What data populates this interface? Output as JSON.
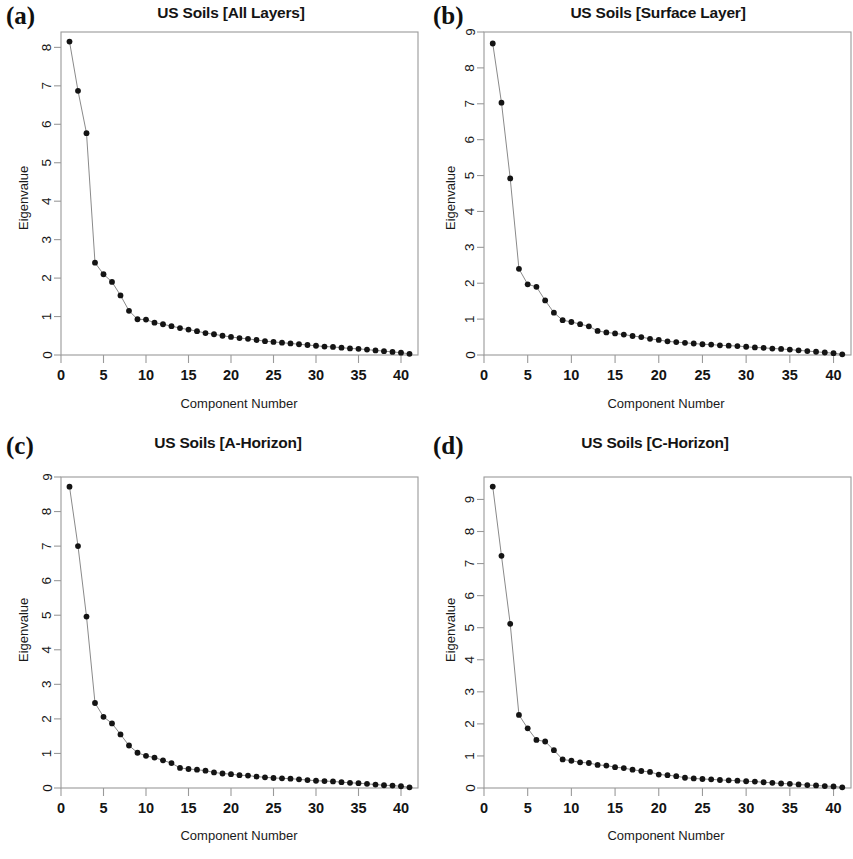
{
  "figure": {
    "background": "#ffffff",
    "point_color": "#141414",
    "line_color": "#8a8a8a",
    "axis_color": "#9a9a9a",
    "text_color": "#141414"
  },
  "panels": [
    {
      "letter": "(a)",
      "title": "US Soils [All Layers]",
      "ylabel": "Eigenvalue",
      "xlabel": "Component Number"
    },
    {
      "letter": "(b)",
      "title": "US Soils [Surface Layer]",
      "ylabel": "Eigenvalue",
      "xlabel": "Component Number"
    },
    {
      "letter": "(c)",
      "title": "US Soils [A-Horizon]",
      "ylabel": "Eigenvalue",
      "xlabel": "Component Number"
    },
    {
      "letter": "(d)",
      "title": "US Soils [C-Horizon]",
      "ylabel": "Eigenvalue",
      "xlabel": "Component Number"
    }
  ],
  "chart_data": [
    {
      "type": "line",
      "panel": "(a)",
      "title": "US Soils [All Layers]",
      "xlabel": "Component Number",
      "ylabel": "Eigenvalue",
      "xlim": [
        0,
        42
      ],
      "ylim": [
        0,
        8.4
      ],
      "xticks": [
        0,
        5,
        10,
        15,
        20,
        25,
        30,
        35,
        40
      ],
      "yticks": [
        0,
        1,
        2,
        3,
        4,
        5,
        6,
        7,
        8
      ],
      "grid": false,
      "legend": null,
      "markers": "filled-circle",
      "x": [
        1,
        2,
        3,
        4,
        5,
        6,
        7,
        8,
        9,
        10,
        11,
        12,
        13,
        14,
        15,
        16,
        17,
        18,
        19,
        20,
        21,
        22,
        23,
        24,
        25,
        26,
        27,
        28,
        29,
        30,
        31,
        32,
        33,
        34,
        35,
        36,
        37,
        38,
        39,
        40,
        41
      ],
      "values": [
        8.15,
        6.87,
        5.77,
        2.4,
        2.1,
        1.9,
        1.55,
        1.15,
        0.93,
        0.92,
        0.84,
        0.8,
        0.75,
        0.7,
        0.66,
        0.62,
        0.57,
        0.54,
        0.5,
        0.47,
        0.44,
        0.42,
        0.39,
        0.36,
        0.34,
        0.32,
        0.3,
        0.28,
        0.26,
        0.24,
        0.22,
        0.21,
        0.19,
        0.17,
        0.16,
        0.14,
        0.12,
        0.1,
        0.08,
        0.06,
        0.03
      ]
    },
    {
      "type": "line",
      "panel": "(b)",
      "title": "US Soils [Surface Layer]",
      "xlabel": "Component Number",
      "ylabel": "Eigenvalue",
      "xlim": [
        0,
        42
      ],
      "ylim": [
        0,
        9.0
      ],
      "xticks": [
        0,
        5,
        10,
        15,
        20,
        25,
        30,
        35,
        40
      ],
      "yticks": [
        0,
        1,
        2,
        3,
        4,
        5,
        6,
        7,
        8,
        9
      ],
      "grid": false,
      "legend": null,
      "markers": "filled-circle",
      "x": [
        1,
        2,
        3,
        4,
        5,
        6,
        7,
        8,
        9,
        10,
        11,
        12,
        13,
        14,
        15,
        16,
        17,
        18,
        19,
        20,
        21,
        22,
        23,
        24,
        25,
        26,
        27,
        28,
        29,
        30,
        31,
        32,
        33,
        34,
        35,
        36,
        37,
        38,
        39,
        40,
        41
      ],
      "values": [
        8.68,
        7.03,
        4.92,
        2.4,
        1.97,
        1.9,
        1.52,
        1.18,
        0.97,
        0.92,
        0.86,
        0.8,
        0.67,
        0.63,
        0.6,
        0.57,
        0.53,
        0.5,
        0.45,
        0.42,
        0.38,
        0.36,
        0.34,
        0.32,
        0.3,
        0.29,
        0.27,
        0.26,
        0.25,
        0.23,
        0.21,
        0.2,
        0.18,
        0.17,
        0.15,
        0.13,
        0.11,
        0.09,
        0.07,
        0.05,
        0.02
      ]
    },
    {
      "type": "line",
      "panel": "(c)",
      "title": "US Soils [A-Horizon]",
      "xlabel": "Component Number",
      "ylabel": "Eigenvalue",
      "xlim": [
        0,
        42
      ],
      "ylim": [
        0,
        9.0
      ],
      "xticks": [
        0,
        5,
        10,
        15,
        20,
        25,
        30,
        35,
        40
      ],
      "yticks": [
        0,
        1,
        2,
        3,
        4,
        5,
        6,
        7,
        8,
        9
      ],
      "grid": false,
      "legend": null,
      "markers": "filled-circle",
      "x": [
        1,
        2,
        3,
        4,
        5,
        6,
        7,
        8,
        9,
        10,
        11,
        12,
        13,
        14,
        15,
        16,
        17,
        18,
        19,
        20,
        21,
        22,
        23,
        24,
        25,
        26,
        27,
        28,
        29,
        30,
        31,
        32,
        33,
        34,
        35,
        36,
        37,
        38,
        39,
        40,
        41
      ],
      "values": [
        8.72,
        7.0,
        4.96,
        2.46,
        2.06,
        1.87,
        1.55,
        1.23,
        1.02,
        0.93,
        0.88,
        0.8,
        0.72,
        0.58,
        0.55,
        0.53,
        0.5,
        0.45,
        0.42,
        0.4,
        0.37,
        0.36,
        0.33,
        0.31,
        0.29,
        0.28,
        0.27,
        0.25,
        0.23,
        0.21,
        0.2,
        0.19,
        0.17,
        0.15,
        0.14,
        0.12,
        0.1,
        0.08,
        0.07,
        0.05,
        0.02
      ]
    },
    {
      "type": "line",
      "panel": "(d)",
      "title": "US Soils [C-Horizon]",
      "xlabel": "Component Number",
      "ylabel": "Eigenvalue",
      "xlim": [
        0,
        42
      ],
      "ylim": [
        0,
        9.7
      ],
      "xticks": [
        0,
        5,
        10,
        15,
        20,
        25,
        30,
        35,
        40
      ],
      "yticks": [
        0,
        1,
        2,
        3,
        4,
        5,
        6,
        7,
        8,
        9
      ],
      "grid": false,
      "legend": null,
      "markers": "filled-circle",
      "x": [
        1,
        2,
        3,
        4,
        5,
        6,
        7,
        8,
        9,
        10,
        11,
        12,
        13,
        14,
        15,
        16,
        17,
        18,
        19,
        20,
        21,
        22,
        23,
        24,
        25,
        26,
        27,
        28,
        29,
        30,
        31,
        32,
        33,
        34,
        35,
        36,
        37,
        38,
        39,
        40,
        41
      ],
      "values": [
        9.4,
        7.24,
        5.12,
        2.28,
        1.86,
        1.5,
        1.45,
        1.18,
        0.89,
        0.85,
        0.8,
        0.78,
        0.72,
        0.7,
        0.65,
        0.62,
        0.57,
        0.53,
        0.5,
        0.42,
        0.4,
        0.37,
        0.32,
        0.3,
        0.28,
        0.27,
        0.25,
        0.24,
        0.23,
        0.21,
        0.2,
        0.18,
        0.16,
        0.14,
        0.13,
        0.11,
        0.09,
        0.08,
        0.06,
        0.05,
        0.02
      ]
    }
  ]
}
